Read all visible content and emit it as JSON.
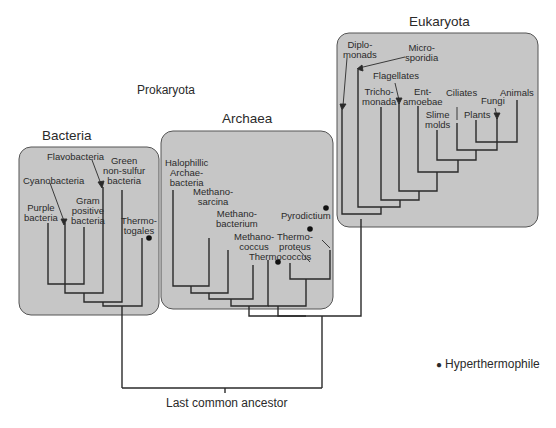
{
  "diagram": {
    "title_prokaryota": "Prokaryota",
    "root_label": "Last common ancestor",
    "legend": {
      "symbol": "●",
      "label": "Hyperthermophile"
    },
    "colors": {
      "box_fill": "#c6c6c6",
      "box_stroke": "#555555",
      "line": "#2a2a2a",
      "background": "#ffffff"
    },
    "groups": {
      "bacteria": {
        "title": "Bacteria",
        "taxa": [
          "Purple bacteria",
          "Cyanobacteria",
          "Flavobacteria",
          "Gram positive bacteria",
          "Green non-sulfur bacteria",
          "Thermotogales"
        ]
      },
      "archaea": {
        "title": "Archaea",
        "taxa": [
          "Halophillic Archaebacteria",
          "Methanosarcina",
          "Methanobacterium",
          "Methanococcus",
          "Thermococcus",
          "Thermoproteus",
          "Pyrodictium"
        ]
      },
      "eukaryota": {
        "title": "Eukaryota",
        "taxa": [
          "Diplomonads",
          "Microsporidia",
          "Trichomonada",
          "Flagellates",
          "Entamoebae",
          "Slime molds",
          "Ciliates",
          "Plants",
          "Fungi",
          "Animals"
        ]
      }
    },
    "labels": {
      "purple": "Purple\nbacteria",
      "cyano": "Cyanobacteria",
      "flavo": "Flavobacteria",
      "gram": "Gram\npositive\nbacteria",
      "green": "Green\nnon-sulfur\nbacteria",
      "thermotogales": "Thermo-\ntogales",
      "halo": "Halophillic\nArchae-\nbacteria",
      "methanosarcina": "Methano-\nsarcina",
      "methanobacterium": "Methano-\nbacterium",
      "methanococcus": "Methano-\ncoccus",
      "thermococcus": "Thermococcus",
      "thermoproteus": "Thermo-\nproteus",
      "pyrodictium": "Pyrodictium",
      "diplomonads": "Diplo-\nmonads",
      "microsporidia": "Micro-\nsporidia",
      "flagellates": "Flagellates",
      "trichomonada": "Tricho-\nmonada",
      "entamoebae": "Ent-\namoebae",
      "slime": "Slime\nmolds",
      "ciliates": "Ciliates",
      "plants": "Plants",
      "fungi": "Fungi",
      "animals": "Animals"
    },
    "hyperthermophiles": [
      "Thermotogales",
      "Thermococcus",
      "Thermoproteus",
      "Pyrodictium"
    ]
  }
}
